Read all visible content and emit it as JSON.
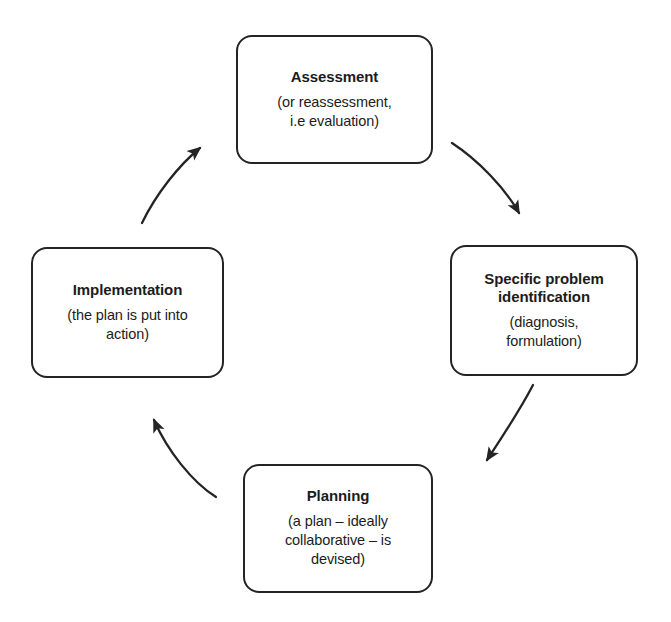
{
  "diagram": {
    "type": "cycle",
    "background_color": "#ffffff",
    "stroke_color": "#242424",
    "text_color": "#1c1c1c",
    "nodes": [
      {
        "id": "assessment",
        "title": "Assessment",
        "subtitle": "(or reassessment,\ni.e evaluation)"
      },
      {
        "id": "specific-problem-identification",
        "title": "Specific problem\nidentification",
        "subtitle": "(diagnosis,\nformulation)"
      },
      {
        "id": "planning",
        "title": "Planning",
        "subtitle": "(a plan – ideally\ncollaborative – is\ndevised)"
      },
      {
        "id": "implementation",
        "title": "Implementation",
        "subtitle": "(the plan is put into\naction)"
      }
    ],
    "arrows": [
      {
        "id": "assessment-to-specific-problem",
        "from": "assessment",
        "to": "specific-problem-identification",
        "direction": "clockwise"
      },
      {
        "id": "specific-problem-to-planning",
        "from": "specific-problem-identification",
        "to": "planning",
        "direction": "clockwise"
      },
      {
        "id": "planning-to-implementation",
        "from": "planning",
        "to": "implementation",
        "direction": "clockwise"
      },
      {
        "id": "implementation-to-assessment",
        "from": "implementation",
        "to": "assessment",
        "direction": "clockwise"
      }
    ]
  }
}
